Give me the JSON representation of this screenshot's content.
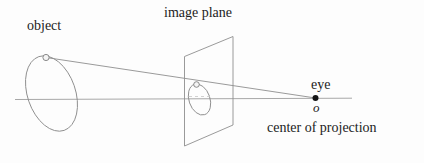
{
  "figure": {
    "title_visible": false,
    "width": 424,
    "height": 163,
    "background_color": "#fdfdfd",
    "line_color": "#8f8f8f",
    "text_color": "#1c1c1c",
    "labels": {
      "object": "object",
      "image_plane": "image plane",
      "eye": "eye",
      "origin": "o",
      "center_of_projection": "center of projection"
    },
    "elements": {
      "object_ellipse_name": "object-ellipse",
      "image_ellipse_name": "projected-image-ellipse",
      "image_plane_name": "image-plane-quad",
      "optical_axis_name": "optical-axis-line",
      "projection_ray_name": "projection-ray-line",
      "object_point_name": "object-point-marker",
      "image_point_name": "image-point-marker",
      "eye_point_name": "eye-point-marker"
    }
  }
}
